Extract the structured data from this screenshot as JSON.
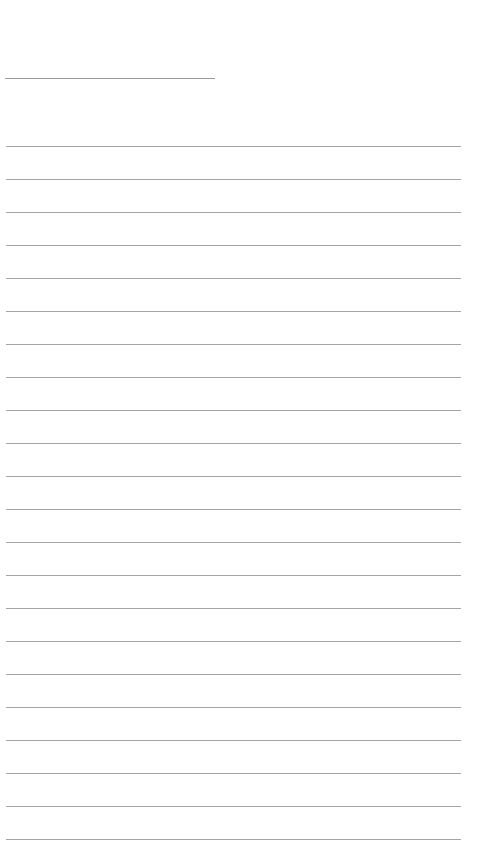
{
  "note": {
    "title_value": "",
    "body_value": "",
    "line_color": "#a4a4a4",
    "title_line_color": "#9a9a9a",
    "background_color": "#ffffff",
    "ruled_line_count": 22,
    "ruled_line_spacing_px": 33,
    "first_ruled_line_y": 146
  }
}
